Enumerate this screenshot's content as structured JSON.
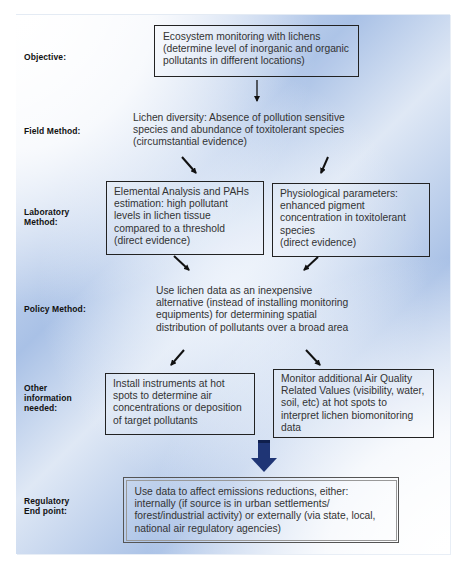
{
  "diagram": {
    "colors": {
      "panel_blue": "#a9c1e6",
      "big_arrow": "#1f3575",
      "box_border": "#222222",
      "text": "#333333"
    },
    "rows": [
      {
        "id": "objective",
        "label": "Objective:"
      },
      {
        "id": "field",
        "label": "Field Method:"
      },
      {
        "id": "laboratory",
        "label": "Laboratory\nMethod:"
      },
      {
        "id": "policy",
        "label": "Policy Method:"
      },
      {
        "id": "other",
        "label": "Other\ninformation\nneeded:"
      },
      {
        "id": "regulatory",
        "label": "Regulatory\nEnd point:"
      }
    ],
    "nodes": {
      "objective": "Ecosystem monitoring with lichens\n(determine level of inorganic and organic\npollutants in different locations)",
      "field": "Lichen diversity: Absence of pollution sensitive\nspecies and abundance of toxitolerant species\n(circumstantial evidence)",
      "lab_left": "Elemental Analysis and PAHs\nestimation: high pollutant\nlevels in lichen tissue\ncompared to a threshold\n(direct evidence)",
      "lab_right": "Physiological parameters:\nenhanced pigment\nconcentration in toxitolerant\nspecies\n(direct evidence)",
      "policy": "Use lichen data as an inexpensive\nalternative (instead of installing monitoring\nequipments) for determining spatial\ndistribution of pollutants over a broad area",
      "other_left": "Install instruments at hot\nspots to determine air\nconcentrations or deposition\nof target pollutants",
      "other_right": "Monitor additional Air Quality\nRelated Values (visibility, water,\nsoil, etc) at hot spots to\ninterpret lichen biomonitoring\ndata",
      "regulatory": "Use data to affect emissions reductions, either:\ninternally (if source is in urban settlements/\nforest/industrial activity) or externally (via state, local,\nnational air regulatory agencies)"
    },
    "edges": [
      {
        "from": "objective",
        "to": "field",
        "style": "down-arrow"
      },
      {
        "from": "field",
        "to": "lab_left",
        "style": "diagonal-arrow"
      },
      {
        "from": "field",
        "to": "lab_right",
        "style": "diagonal-arrow"
      },
      {
        "from": "lab_left",
        "to": "policy",
        "style": "diagonal-arrow"
      },
      {
        "from": "lab_right",
        "to": "policy",
        "style": "diagonal-arrow"
      },
      {
        "from": "policy",
        "to": "other_left",
        "style": "diagonal-arrow"
      },
      {
        "from": "policy",
        "to": "other_right",
        "style": "diagonal-arrow"
      },
      {
        "from": "other",
        "to": "regulatory",
        "style": "block-arrow"
      }
    ]
  }
}
